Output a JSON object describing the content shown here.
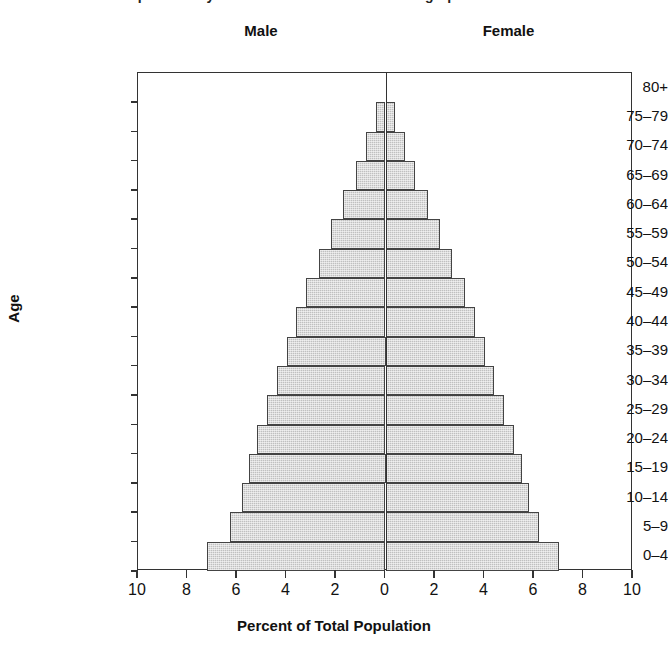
{
  "chart_data": {
    "type": "bar",
    "title": "Population Pyramid at the Onset of the Demographic Transition",
    "subtitle": "",
    "xlabel": "Percent of Total Population",
    "ylabel": "Age",
    "orientation": "horizontal-diverging",
    "grid": false,
    "legend_position": "top",
    "xlim": [
      -10,
      10
    ],
    "xticks": [
      10,
      8,
      6,
      4,
      2,
      0,
      2,
      4,
      6,
      8,
      10
    ],
    "xtick_values": [
      -10,
      -8,
      -6,
      -4,
      -2,
      0,
      2,
      4,
      6,
      8,
      10
    ],
    "categories": [
      "80+",
      "75–79",
      "70–74",
      "65–69",
      "60–64",
      "55–59",
      "50–54",
      "45–49",
      "40–44",
      "35–39",
      "30–34",
      "25–29",
      "20–24",
      "15–19",
      "10–14",
      "5–9",
      "0–4"
    ],
    "series": [
      {
        "name": "Male",
        "side": "left",
        "values": [
          0.0,
          0.4,
          0.8,
          1.2,
          1.7,
          2.2,
          2.7,
          3.2,
          3.6,
          4.0,
          4.4,
          4.8,
          5.2,
          5.5,
          5.8,
          6.3,
          7.2
        ]
      },
      {
        "name": "Female",
        "side": "right",
        "values": [
          0.0,
          0.4,
          0.8,
          1.2,
          1.7,
          2.2,
          2.7,
          3.2,
          3.6,
          4.0,
          4.4,
          4.8,
          5.2,
          5.5,
          5.8,
          6.2,
          7.0
        ]
      }
    ],
    "colors": {
      "bar_fill": "#c0c0c0",
      "bar_edge": "#444444",
      "axis": "#333333",
      "text": "#111111",
      "background": "#ffffff"
    }
  },
  "legend": {
    "male_label": "Male",
    "female_label": "Female"
  }
}
